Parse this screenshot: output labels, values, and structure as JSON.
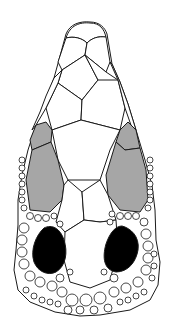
{
  "figure": {
    "type": "head-scale-diagram",
    "view": "dorsal",
    "colors": {
      "background": "#ffffff",
      "outline": "#1a1a1a",
      "shaded_scales": "#a6a6a6",
      "dark_scales": "#000000"
    },
    "regions": [
      {
        "name": "rostral-tip",
        "fill": "white"
      },
      {
        "name": "internasals",
        "fill": "white"
      },
      {
        "name": "prefrontals",
        "fill": "white"
      },
      {
        "name": "frontal",
        "fill": "white"
      },
      {
        "name": "supraoculars",
        "fill": "grey"
      },
      {
        "name": "parietals",
        "fill": "white"
      },
      {
        "name": "temporal-dark-scales",
        "fill": "black"
      },
      {
        "name": "occipital-granules",
        "fill": "white"
      }
    ]
  }
}
